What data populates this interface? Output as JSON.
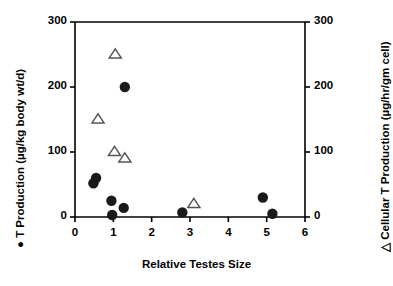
{
  "chart_data": {
    "type": "scatter",
    "title": "",
    "xlabel": "Relative Testes Size",
    "ylabel": "T Production (µg/kg body wt/d)",
    "y2label": "Cellular T Production (µg/hr/gm cell)",
    "xlim": [
      0,
      6
    ],
    "ylim": [
      0,
      300
    ],
    "y2lim": [
      0,
      300
    ],
    "xticks": [
      "0",
      "1",
      "2",
      "3",
      "4",
      "5",
      "6"
    ],
    "yticks": [
      "0",
      "100",
      "200",
      "300"
    ],
    "y2ticks": [
      "0",
      "100",
      "200",
      "300"
    ],
    "grid": false,
    "legend_position": "axis-labels",
    "series": [
      {
        "name": "T Production (µg/kg body wt/d)",
        "marker": "filled-circle",
        "marker_symbol": "●",
        "axis": "left",
        "color": "#1a1a1a",
        "points": [
          {
            "x": 0.48,
            "y": 52
          },
          {
            "x": 0.55,
            "y": 60
          },
          {
            "x": 0.95,
            "y": 25
          },
          {
            "x": 0.97,
            "y": 3
          },
          {
            "x": 1.27,
            "y": 14
          },
          {
            "x": 1.3,
            "y": 200
          },
          {
            "x": 2.8,
            "y": 7
          },
          {
            "x": 4.9,
            "y": 30
          },
          {
            "x": 5.15,
            "y": 5
          }
        ]
      },
      {
        "name": "Cellular T Production (µg/hr/gm cell)",
        "marker": "open-triangle",
        "marker_symbol": "△",
        "axis": "right",
        "color": "#555555",
        "points": [
          {
            "x": 0.6,
            "y": 150
          },
          {
            "x": 1.05,
            "y": 250
          },
          {
            "x": 1.03,
            "y": 100
          },
          {
            "x": 1.3,
            "y": 90
          },
          {
            "x": 3.1,
            "y": 20
          }
        ]
      }
    ]
  },
  "figure": {
    "ghost_header": "",
    "xlabel": "Relative Testes Size",
    "ylabel_left": "●  T Production (µg/kg body wt/d)",
    "ylabel_right": "△  Cellular T Production (µg/hr/gm cell)"
  },
  "axis_labels": {
    "x": [
      "0",
      "1",
      "2",
      "3",
      "4",
      "5",
      "6"
    ],
    "y_left": [
      "0",
      "100",
      "200",
      "300"
    ],
    "y_right": [
      "0",
      "100",
      "200",
      "300"
    ]
  }
}
